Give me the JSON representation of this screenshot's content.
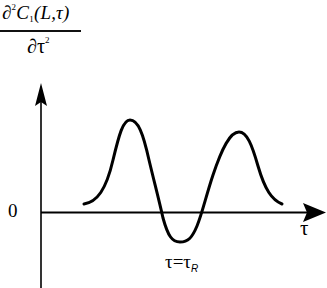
{
  "diagram": {
    "y_axis_label": {
      "numerator_prefix": "∂",
      "numerator_power": "2",
      "numerator_func": "C",
      "numerator_sub": "1",
      "numerator_args": "(L,τ)",
      "denominator_base": "∂τ",
      "denominator_power": "2"
    },
    "origin_label": "0",
    "x_axis_label": "τ",
    "marker_label_main": "τ=τ",
    "marker_label_sub": "R",
    "curve_description": "Second derivative curve: positive peak, negative trough at τ=τR, second positive peak"
  },
  "colors": {
    "line": "#000000",
    "background": "#ffffff"
  }
}
